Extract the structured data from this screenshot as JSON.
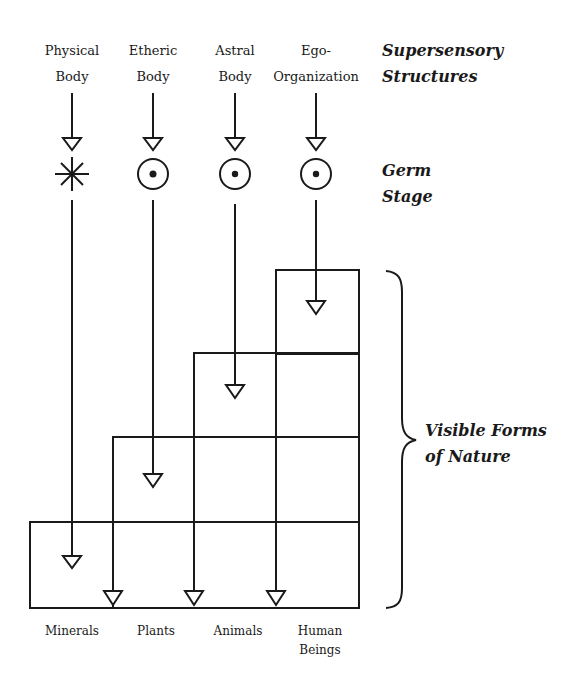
{
  "diagram": {
    "top_columns": [
      {
        "line1": "Physical",
        "line2": "Body",
        "germ_symbol": "asterisk-star"
      },
      {
        "line1": "Etheric",
        "line2": "Body",
        "germ_symbol": "circled-dot"
      },
      {
        "line1": "Astral",
        "line2": "Body",
        "germ_symbol": "circled-dot"
      },
      {
        "line1": "Ego-",
        "line2": "Organization",
        "germ_symbol": "circled-dot"
      }
    ],
    "side_labels": {
      "supersensory": {
        "line1": "Supersensory",
        "line2": "Structures"
      },
      "germ": {
        "line1": "Germ",
        "line2": "Stage"
      },
      "visible": {
        "line1": "Visible Forms",
        "line2": "of Nature"
      }
    },
    "bottom_labels": [
      {
        "line1": "Minerals",
        "line2": ""
      },
      {
        "line1": "Plants",
        "line2": ""
      },
      {
        "line1": "Animals",
        "line2": ""
      },
      {
        "line1": "Human",
        "line2": "Beings"
      }
    ],
    "colors": {
      "ink": "#1a1a1a",
      "background": "#ffffff"
    }
  }
}
